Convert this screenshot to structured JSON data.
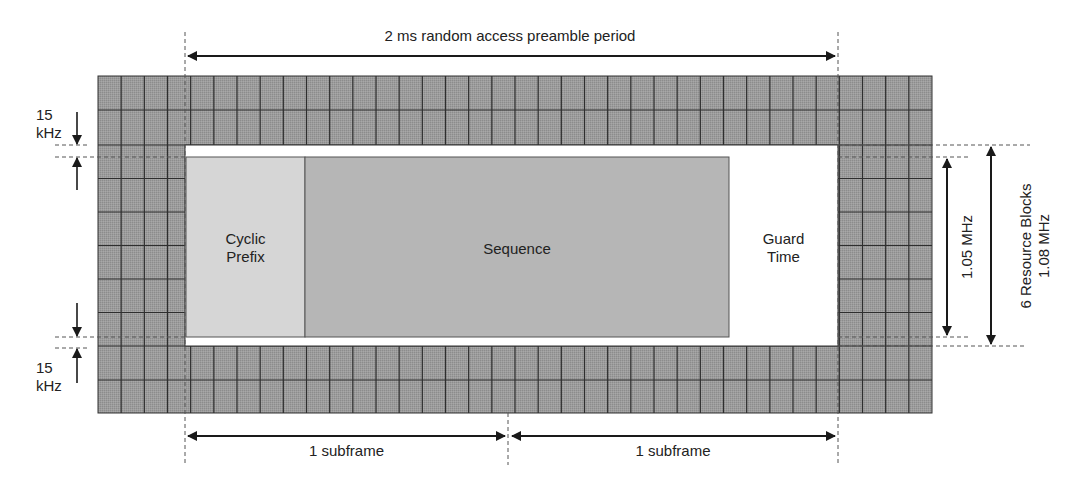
{
  "diagram": {
    "title": "2 ms random access preamble period",
    "regions": {
      "cyclic_prefix": "Cyclic\nPrefix",
      "cyclic_prefix_line1": "Cyclic",
      "cyclic_prefix_line2": "Prefix",
      "sequence": "Sequence",
      "guard_time_line1": "Guard",
      "guard_time_line2": "Time"
    },
    "left_annotations": {
      "top_spacing_line1": "15",
      "top_spacing_line2": "kHz",
      "bottom_spacing_line1": "15",
      "bottom_spacing_line2": "kHz"
    },
    "right_annotations": {
      "preamble_bandwidth": "1.05 MHz",
      "resource_blocks_line1": "6 Resource Blocks",
      "resource_blocks_line2": "1.08 MHz"
    },
    "bottom_annotations": {
      "subframe_1": "1 subframe",
      "subframe_2": "1 subframe"
    },
    "colors": {
      "grid_fill": "#9a9a9a",
      "grid_line": "#333333",
      "cyclic_prefix_fill": "#d6d6d6",
      "sequence_fill": "#b4b4b4",
      "guard_fill": "#ffffff",
      "arrow": "#1a1a1a"
    }
  }
}
